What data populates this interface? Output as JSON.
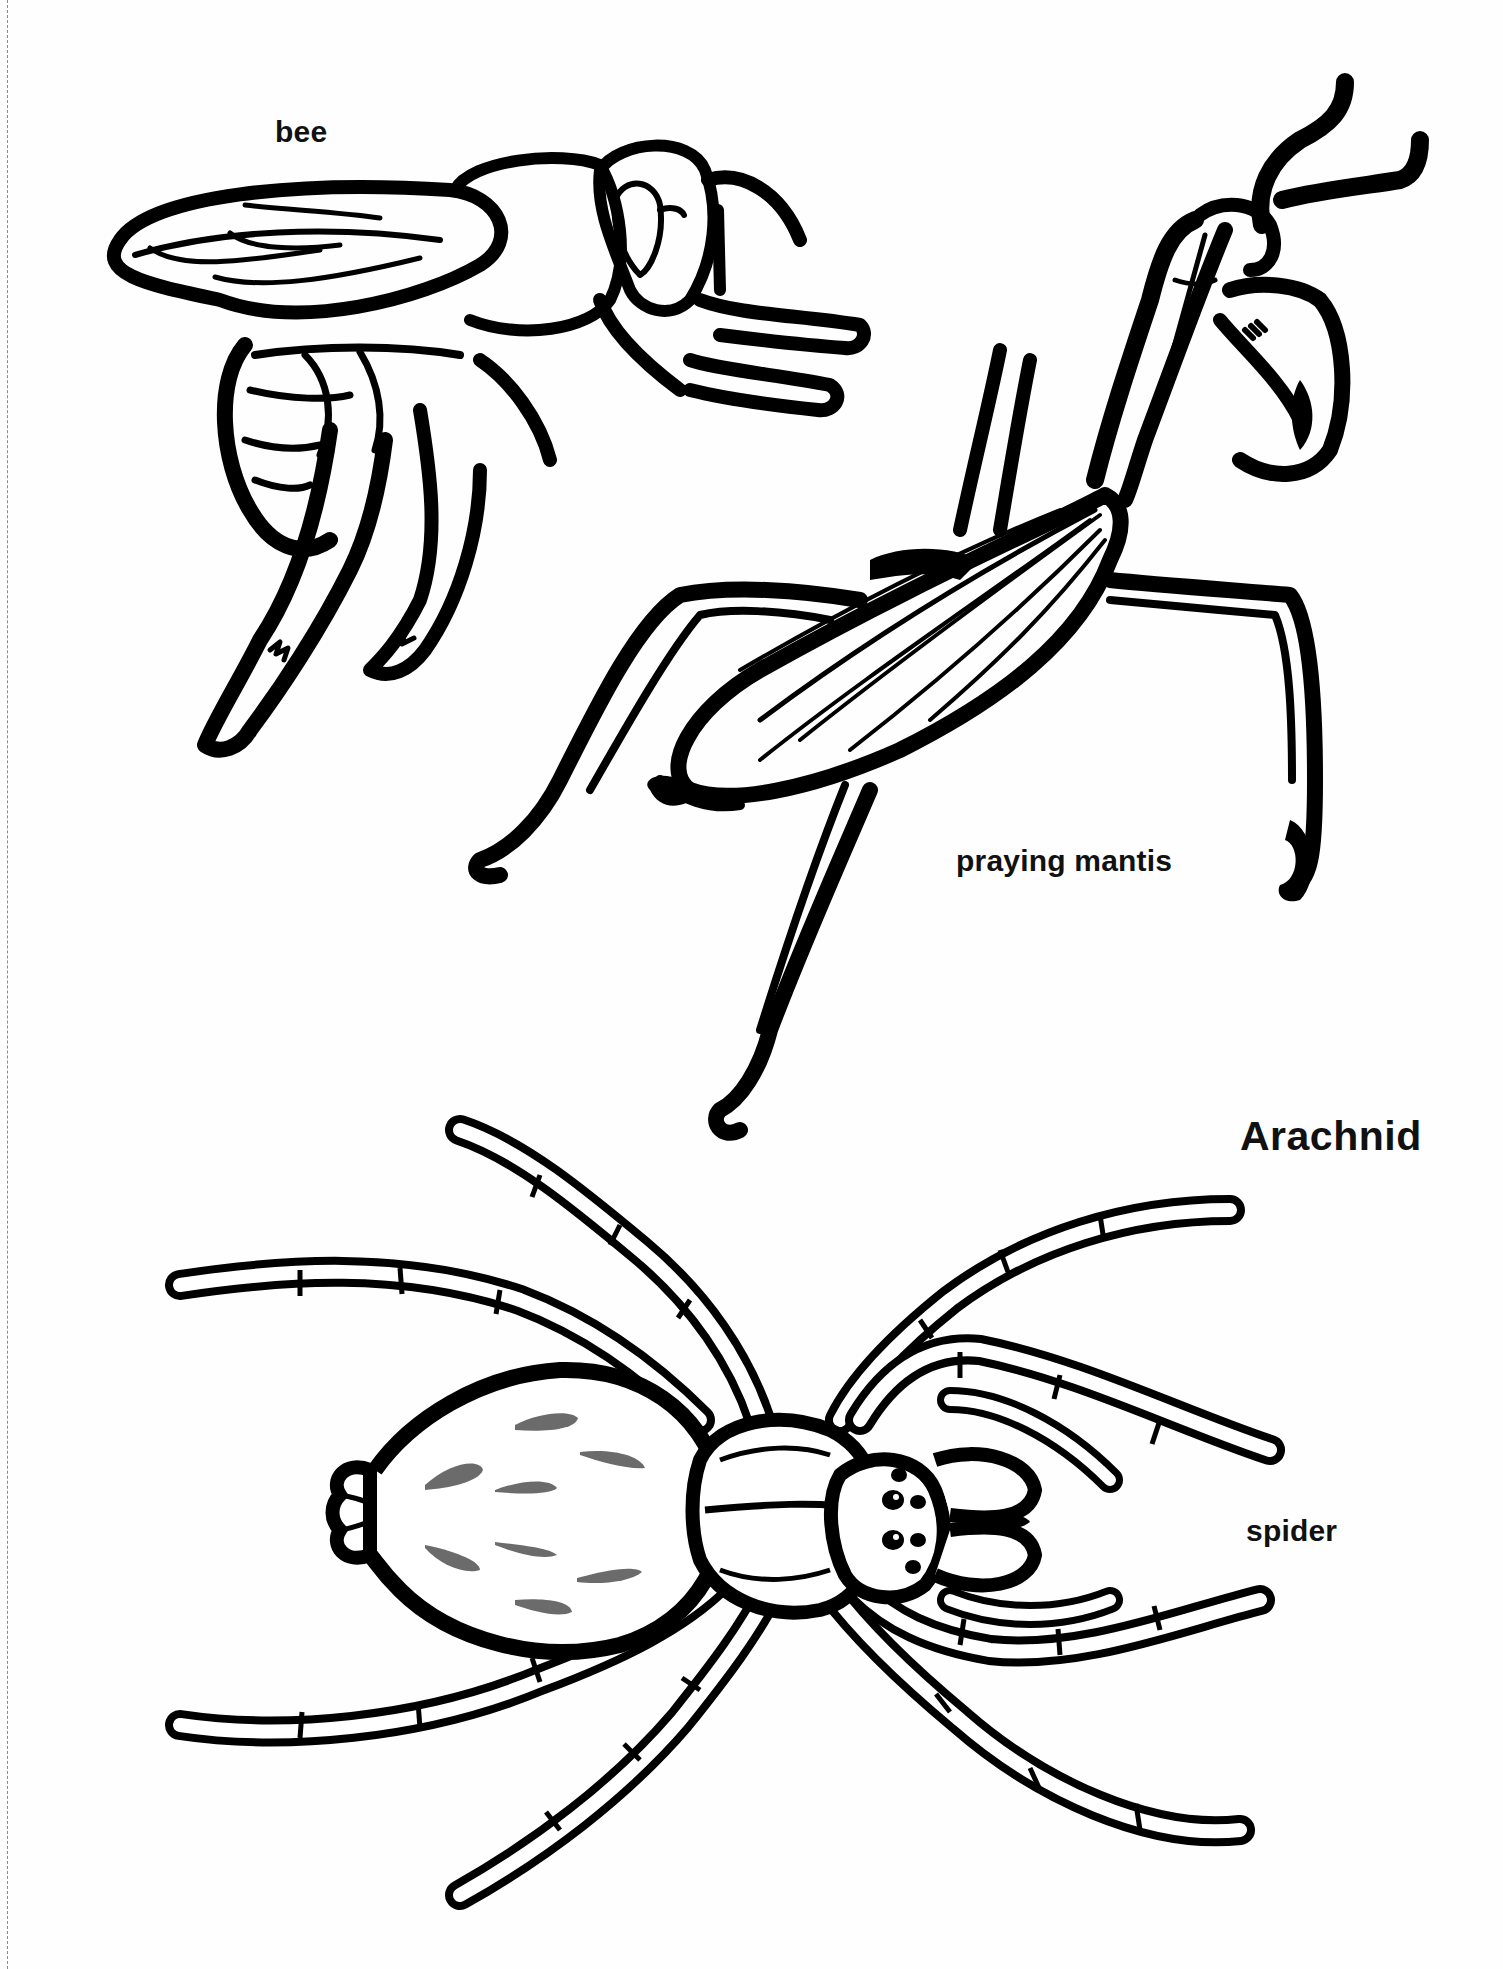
{
  "page": {
    "background": "#fefefe",
    "ink_color": "#000000",
    "accent_gray": "#6b6b6b"
  },
  "labels": {
    "bee": "bee",
    "praying_mantis": "praying mantis",
    "section_heading": "Arachnid",
    "spider": "spider"
  },
  "illustrations": [
    {
      "name": "bee",
      "style": "black outline coloring-page drawing"
    },
    {
      "name": "praying mantis",
      "style": "black outline coloring-page drawing"
    },
    {
      "name": "spider",
      "style": "black outline coloring-page drawing with gray abdomen markings"
    }
  ]
}
